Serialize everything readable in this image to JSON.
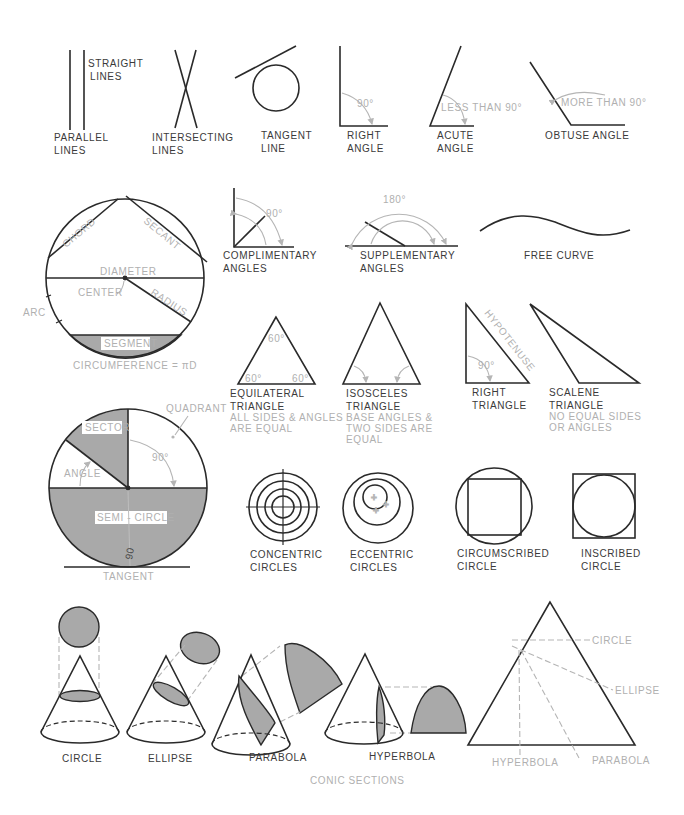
{
  "figure": {
    "lines": {
      "straight": [
        "STRAIGHT",
        "LINES"
      ],
      "parallel": [
        "PARALLEL",
        "LINES"
      ],
      "intersecting": [
        "INTERSECTING",
        "LINES"
      ],
      "tangent": [
        "TANGENT",
        "LINE"
      ]
    },
    "angles": {
      "right": [
        "RIGHT",
        "ANGLE"
      ],
      "right_note": "90°",
      "acute": [
        "ACUTE",
        "ANGLE"
      ],
      "acute_note": "LESS THAN 90°",
      "obtuse": "OBTUSE ANGLE",
      "obtuse_note": "MORE THAN 90°",
      "complimentary": [
        "COMPLIMENTARY",
        "ANGLES"
      ],
      "complimentary_note": "90°",
      "supplementary": [
        "SUPPLEMENTARY",
        "ANGLES"
      ],
      "supplementary_note": "180°"
    },
    "free_curve": "FREE CURVE",
    "circle_parts": {
      "chord": "CHORD",
      "secant": "SECANT",
      "diameter": "DIAMETER",
      "center": "CENTER",
      "radius": "RADIUS",
      "arc": "ARC",
      "segment": "SEGMENT",
      "circumference": "CIRCUMFERENCE = πD"
    },
    "circle_regions": {
      "quadrant": "QUADRANT",
      "sector": "SECTOR",
      "angle": "ANGLE",
      "angle_90": "90°",
      "semicircle": "SEMI - CIRCLE",
      "tangent": "TANGENT",
      "handwritten": "90"
    },
    "triangles": {
      "equilateral": [
        "EQUILATERAL",
        "TRIANGLE"
      ],
      "equilateral_note": [
        "ALL SIDES & ANGLES",
        "ARE EQUAL"
      ],
      "equilateral_angle": "60°",
      "isosceles": [
        "ISOSCELES",
        "TRIANGLE"
      ],
      "isosceles_note": [
        "BASE ANGLES &",
        "TWO SIDES ARE",
        "EQUAL"
      ],
      "right": [
        "RIGHT",
        "TRIANGLE"
      ],
      "right_angle": "90°",
      "hypotenuse": "HYPOTENUSE",
      "scalene": [
        "SCALENE",
        "TRIANGLE"
      ],
      "scalene_note": [
        "NO EQUAL SIDES",
        "OR ANGLES"
      ]
    },
    "circles": {
      "concentric": [
        "CONCENTRIC",
        "CIRCLES"
      ],
      "eccentric": [
        "ECCENTRIC",
        "CIRCLES"
      ],
      "circumscribed": [
        "CIRCUMSCRIBED",
        "CIRCLE"
      ],
      "inscribed": [
        "INSCRIBED",
        "CIRCLE"
      ]
    },
    "conics": {
      "circle": "CIRCLE",
      "ellipse": "ELLIPSE",
      "parabola": "PARABOLA",
      "hyperbola": "HYPERBOLA",
      "caption": "CONIC SECTIONS",
      "key_circle": "CIRCLE",
      "key_ellipse": "ELLIPSE",
      "key_hyperbola": "HYPERBOLA",
      "key_parabola": "PARABOLA"
    },
    "colors": {
      "line": "#2a2a2a",
      "note_text": "#b0b0b0",
      "fill": "#a9a9a9"
    }
  }
}
